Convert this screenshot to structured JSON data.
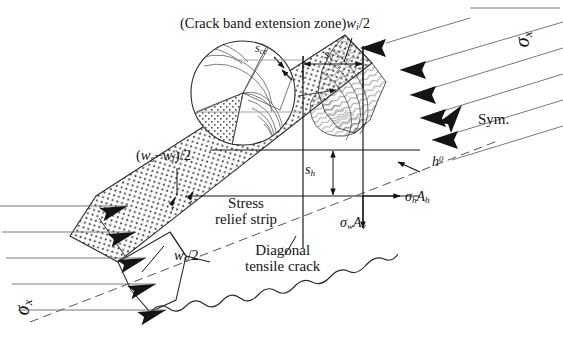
{
  "figure": {
    "type": "engineering-mechanics-diagram",
    "background_color": "#ffffff",
    "line_color": "#141414",
    "hatch_color": "#3a3a3a"
  },
  "labels": {
    "crack_band_zone": "(Crack band extension zone)",
    "wi_over_2": "w",
    "wi_over_2_sub": "i",
    "wi_over_2_tail": "/2",
    "sce": "s",
    "sce_sub": "ce",
    "sv": "s",
    "sv_sub": "v",
    "sh": "s",
    "sh_sub": "h",
    "h0": "h",
    "h0_sup": "0",
    "sym": "Sym.",
    "sigma_x_top": "σ",
    "sigma_x_top_sub": "x",
    "sigma_x_bottom": "σ",
    "sigma_x_bottom_sub": "x",
    "ws_wf_open": "(",
    "ws_wf_w1": "w",
    "ws_wf_s1": "s",
    "ws_wf_minus": "−",
    "ws_wf_w2": "w",
    "ws_wf_s2": "f",
    "ws_wf_close": ")/2",
    "ws_over_2": "w",
    "ws_over_2_sub": "s",
    "ws_over_2_tail": "/2",
    "stress_relief_line1": "Stress",
    "stress_relief_line2": "relief strip",
    "diagonal_line1": "Diagonal",
    "diagonal_line2": "tensile crack",
    "sigma_h": "σ",
    "sigma_h_sub": "h",
    "A_h": "A",
    "A_h_sub": "h",
    "sigma_w": "σ",
    "sigma_w_sub": "w",
    "A_v": "A",
    "A_v_sub": "v"
  }
}
